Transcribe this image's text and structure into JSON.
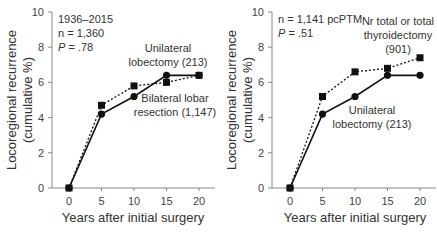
{
  "chart_data": [
    {
      "type": "line",
      "title": "",
      "xlabel": "Years after initial surgery",
      "ylabel_line1": "Locoregional recurrence",
      "ylabel_line2": "(cumulative %)",
      "x": [
        0,
        5,
        10,
        15,
        20
      ],
      "xticks": [
        "0",
        "5",
        "10",
        "15",
        "20"
      ],
      "yticks": [
        "0",
        "2",
        "4",
        "6",
        "8",
        "10"
      ],
      "ylim": [
        0,
        10
      ],
      "xlim": [
        -2.6,
        22.5
      ],
      "grid": false,
      "annotation": {
        "line1": "1936–2015",
        "line2": "n = 1,360",
        "p_label": "P",
        "p_value": " = .78"
      },
      "series": [
        {
          "name": "Unilateral lobectomy (213)",
          "label_line1": "Unilateral",
          "label_line2": "lobectomy (213)",
          "marker": "circle",
          "style": "solid",
          "values": [
            0,
            4.2,
            5.2,
            6.4,
            6.4
          ]
        },
        {
          "name": "Bilateral lobar resection (1,147)",
          "label_line1": "Bilateral lobar",
          "label_line2": "resection (1,147)",
          "marker": "square",
          "style": "dotted",
          "values": [
            0,
            4.7,
            5.8,
            6.0,
            6.4
          ]
        }
      ]
    },
    {
      "type": "line",
      "title": "",
      "xlabel": "Years after initial surgery",
      "ylabel_line1": "Locoregional recurrence",
      "ylabel_line2": "(cumulative %)",
      "x": [
        0,
        5,
        10,
        15,
        20
      ],
      "xticks": [
        "0",
        "5",
        "10",
        "15",
        "20"
      ],
      "yticks": [
        "0",
        "2",
        "4",
        "6",
        "8",
        "10"
      ],
      "ylim": [
        0,
        10
      ],
      "xlim": [
        -2.6,
        22.5
      ],
      "grid": false,
      "annotation": {
        "line1": "n = 1,141 pcPTM",
        "p_label": "P",
        "p_value": " = .51"
      },
      "series": [
        {
          "name": "Nr total or total thyroidectomy (901)",
          "label_line1": "Nr total or total",
          "label_line2": "thyroidectomy",
          "label_line3": "(901)",
          "marker": "square",
          "style": "dotted",
          "values": [
            0,
            5.2,
            6.6,
            6.8,
            7.4
          ]
        },
        {
          "name": "Unilateral lobectomy (213)",
          "label_line1": "Unilateral",
          "label_line2": "lobectomy (213)",
          "marker": "circle",
          "style": "solid",
          "values": [
            0,
            4.2,
            5.2,
            6.4,
            6.4
          ]
        }
      ]
    }
  ]
}
